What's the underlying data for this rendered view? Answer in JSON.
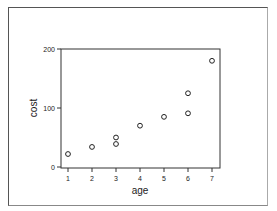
{
  "chart_data": {
    "type": "scatter",
    "title": "",
    "xlabel": "age",
    "ylabel": "cost",
    "xlim": [
      0.7,
      7.3
    ],
    "ylim": [
      0,
      200
    ],
    "xticks": [
      1,
      2,
      3,
      4,
      5,
      6,
      7
    ],
    "yticks": [
      0,
      100,
      200
    ],
    "grid": false,
    "legend": null,
    "points": [
      {
        "x": 1,
        "y": 22
      },
      {
        "x": 2,
        "y": 34
      },
      {
        "x": 3,
        "y": 50
      },
      {
        "x": 3,
        "y": 39
      },
      {
        "x": 4,
        "y": 70
      },
      {
        "x": 5,
        "y": 85
      },
      {
        "x": 6,
        "y": 125
      },
      {
        "x": 6,
        "y": 91
      },
      {
        "x": 7,
        "y": 180
      }
    ],
    "marker": "open-circle"
  },
  "labels": {
    "xlabel": "age",
    "ylabel": "cost",
    "xticks": [
      "1",
      "2",
      "3",
      "4",
      "5",
      "6",
      "7"
    ],
    "yticks": [
      "0",
      "100",
      "200"
    ]
  }
}
